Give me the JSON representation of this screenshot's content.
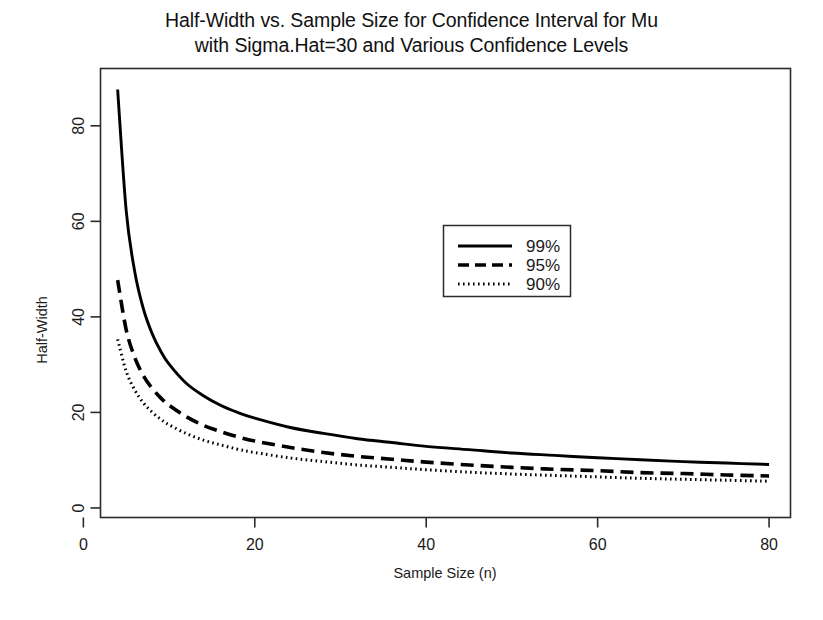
{
  "figure": {
    "title_line1": "Half-Width vs. Sample Size for Confidence Interval for Mu",
    "title_line2": "with Sigma.Hat=30 and Various Confidence Levels",
    "background_color": "#ffffff",
    "foreground_color": "#000000"
  },
  "chart_data": {
    "type": "line",
    "title": "Half-Width vs. Sample Size for Confidence Interval for Mu with Sigma.Hat=30 and Various Confidence Levels",
    "xlabel": "Sample Size (n)",
    "ylabel": "Half-Width",
    "xlim": [
      2.0,
      82.5
    ],
    "ylim": [
      -2.0,
      92.0
    ],
    "xticks": [
      0,
      20,
      40,
      60,
      80
    ],
    "xticklabels": [
      "0",
      "20",
      "40",
      "60",
      "80"
    ],
    "yticks": [
      0,
      20,
      40,
      60,
      80
    ],
    "yticklabels": [
      "0",
      "20",
      "40",
      "60",
      "80"
    ],
    "grid": false,
    "box": true,
    "sigma_hat": 30,
    "legend": {
      "position": "center-right-upper",
      "entries": [
        {
          "label": "99%",
          "style": "solid"
        },
        {
          "label": "95%",
          "style": "dashed"
        },
        {
          "label": "90%",
          "style": "dotted"
        }
      ]
    },
    "x": [
      4,
      5,
      6,
      7,
      8,
      9,
      10,
      12,
      14,
      16,
      18,
      20,
      24,
      28,
      32,
      36,
      40,
      45,
      50,
      55,
      60,
      65,
      70,
      75,
      80
    ],
    "series": [
      {
        "name": "99%",
        "style": "solid",
        "color": "#000000",
        "values": [
          87.6,
          62.2,
          49.4,
          41.7,
          36.6,
          32.9,
          30.1,
          26.1,
          23.5,
          21.5,
          20.0,
          18.8,
          16.9,
          15.6,
          14.5,
          13.7,
          12.9,
          12.2,
          11.5,
          11.0,
          10.5,
          10.1,
          9.7,
          9.4,
          9.1
        ],
        "endpoint": 9.1
      },
      {
        "name": "95%",
        "style": "dashed",
        "color": "#000000",
        "values": [
          47.7,
          37.3,
          31.5,
          27.7,
          25.1,
          23.1,
          21.5,
          19.1,
          17.3,
          16.0,
          14.9,
          14.0,
          12.7,
          11.6,
          10.8,
          10.2,
          9.6,
          9.0,
          8.5,
          8.1,
          7.8,
          7.4,
          7.2,
          6.9,
          6.7
        ],
        "endpoint": 6.7
      },
      {
        "name": "90%",
        "style": "dotted",
        "color": "#000000",
        "values": [
          35.3,
          28.6,
          24.7,
          22.0,
          20.1,
          18.6,
          17.4,
          15.6,
          14.2,
          13.2,
          12.3,
          11.6,
          10.5,
          9.7,
          9.0,
          8.5,
          8.0,
          7.5,
          7.1,
          6.8,
          6.5,
          6.2,
          6.0,
          5.8,
          5.6
        ],
        "endpoint": 5.6
      }
    ]
  }
}
